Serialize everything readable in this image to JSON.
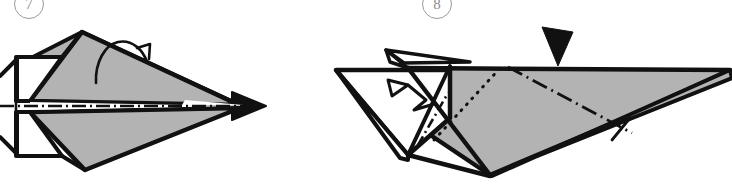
{
  "page": {
    "background_color": "#ffffff",
    "width": 732,
    "height": 194
  },
  "palette": {
    "paper_fill": "#b3b3b3",
    "paper_fill_light": "#ffffff",
    "ink": "#111111",
    "badge_stroke": "#9a9a9a",
    "badge_text": "#8d8d8d"
  },
  "steps": [
    {
      "number": "7",
      "badge_name": "step-number-7",
      "diagram_name": "diagram-step-7",
      "view": "top view of folded paper airplane",
      "annotations": [
        {
          "type": "fold-line",
          "style": "dash-dot",
          "name": "center-fold-line",
          "label": "valley fold along centerline"
        },
        {
          "type": "arrow",
          "style": "curved-thin",
          "name": "turn-over-arrow",
          "label": "fold in half / flip"
        }
      ]
    },
    {
      "number": "8",
      "badge_name": "step-number-8",
      "diagram_name": "diagram-step-8",
      "view": "perspective view of folded paper airplane",
      "annotations": [
        {
          "type": "arrow",
          "style": "solid-triangle",
          "name": "push-arrow",
          "label": "press here"
        },
        {
          "type": "arrow",
          "style": "hollow-triangle",
          "name": "wing-fold-arrow",
          "label": "fold wing down"
        },
        {
          "type": "fold-line",
          "style": "dash-dot",
          "name": "wing-fold-line",
          "label": "wing fold line"
        },
        {
          "type": "hidden-line",
          "style": "dotted",
          "name": "hidden-edge-line",
          "label": "hidden edge"
        }
      ]
    }
  ]
}
